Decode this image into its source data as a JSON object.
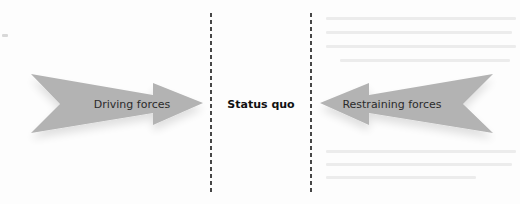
{
  "diagram": {
    "type": "force-field-analysis",
    "background_color": "#fdfdfd",
    "arrow_color": "#b3b3b3",
    "divider_color": "#1a1a1a",
    "left_arrow": {
      "label": "Driving forces",
      "direction": "right"
    },
    "center": {
      "label": "Status quo"
    },
    "right_arrow": {
      "label": "Restraining forces",
      "direction": "left"
    },
    "dividers": [
      {
        "style": "dashed",
        "position": "left"
      },
      {
        "style": "dashed",
        "position": "right"
      }
    ]
  }
}
